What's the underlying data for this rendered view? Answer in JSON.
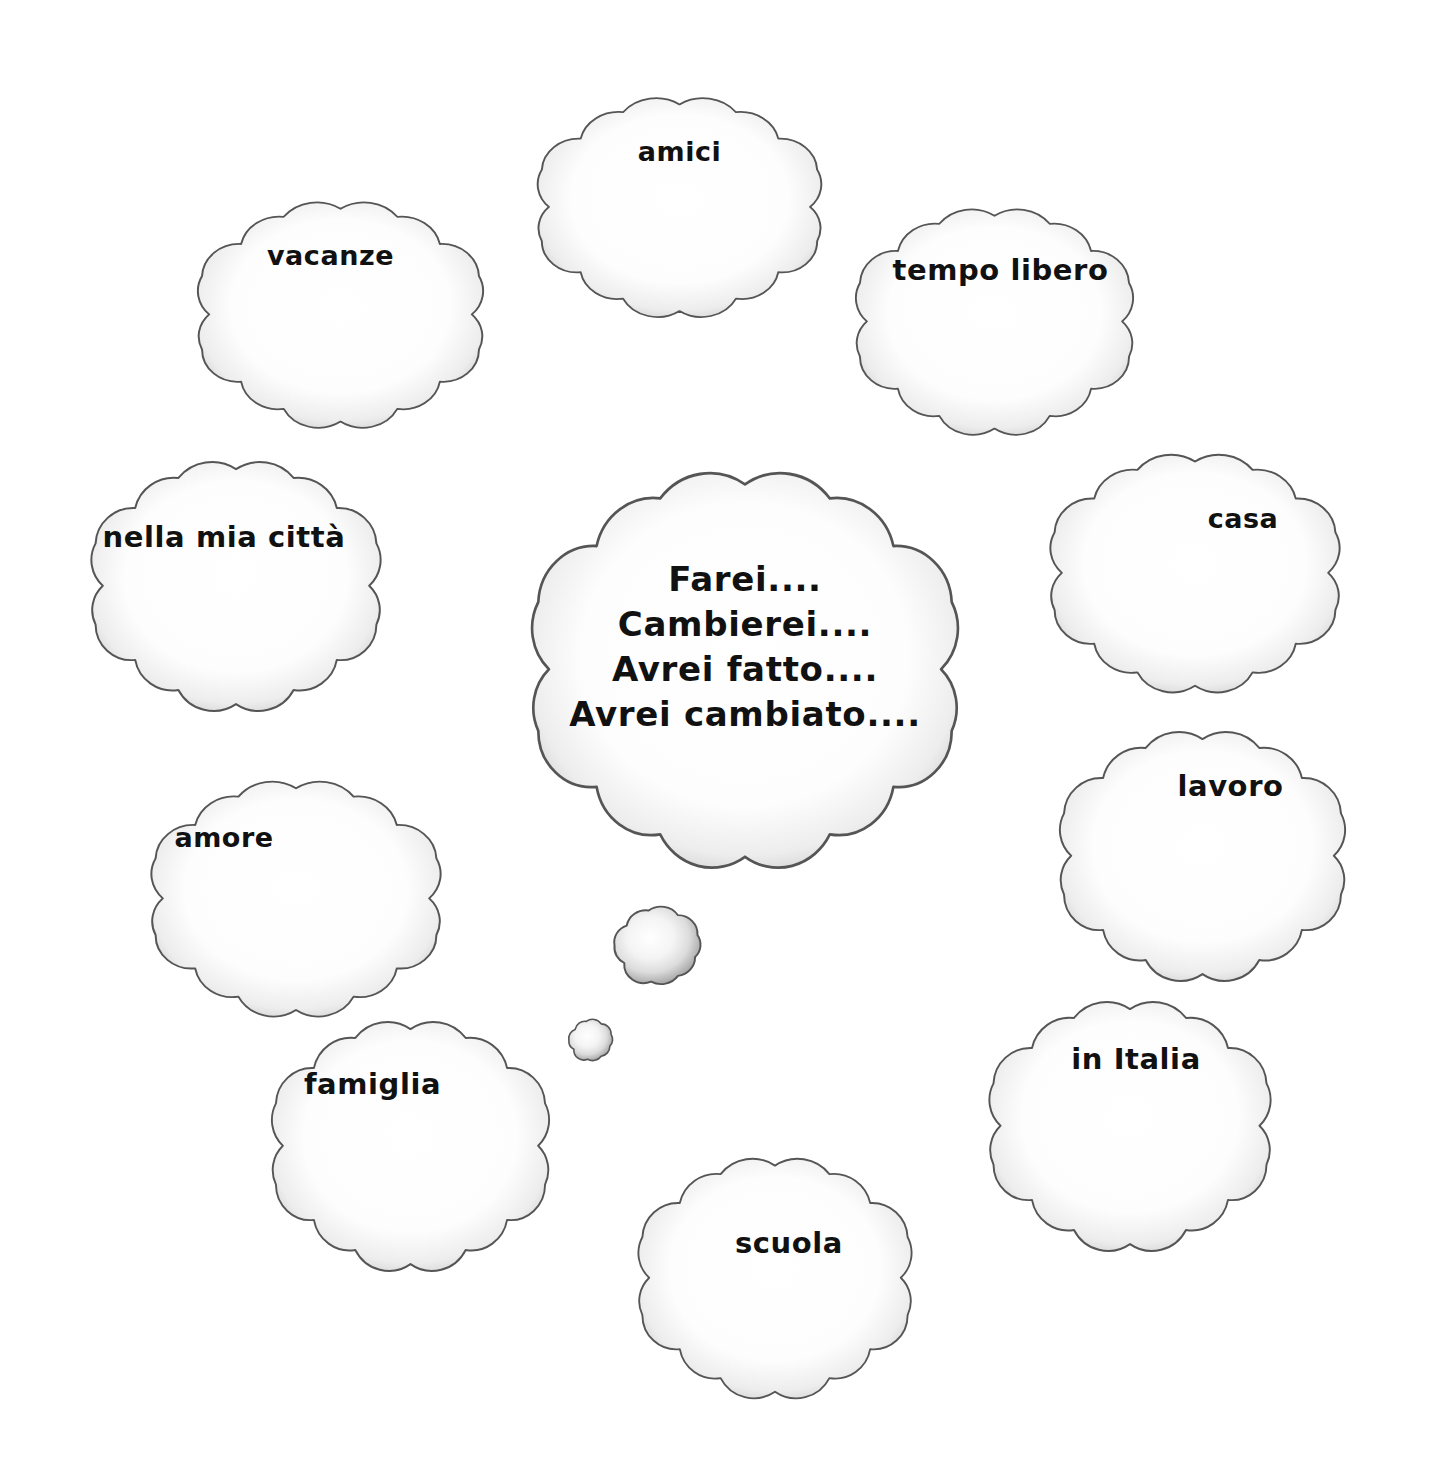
{
  "page": {
    "title": "Farei.... Cambierei.... Avrei fatto.... Avrei cambiato....",
    "language": "Italian",
    "background_color": "#ffffff",
    "outline_color": "#555555",
    "shading_color": "#9a9a9a",
    "text_color": "#111111"
  },
  "center_cloud": {
    "name": "central-thought-cloud",
    "lines": [
      "Farei....",
      "Cambierei....",
      "Avrei fatto....",
      "Avrei cambiato...."
    ],
    "text": "Farei....\nCambierei....\nAvrei fatto....\nAvrei cambiato....",
    "x": 480,
    "y": 462,
    "width": 530,
    "height": 420,
    "font_size": 34
  },
  "tail_bubbles": [
    {
      "name": "tail-bubble-large",
      "x": 595,
      "y": 893,
      "width": 122,
      "height": 105
    },
    {
      "name": "tail-bubble-small",
      "x": 559,
      "y": 1012,
      "width": 62,
      "height": 56
    }
  ],
  "topic_clouds": [
    {
      "id": "vacanze",
      "label": "vacanze",
      "x": 163,
      "y": 196,
      "width": 355,
      "height": 240,
      "font_size": 27,
      "text_top": 42,
      "text_shift": -10
    },
    {
      "id": "amici",
      "label": "amici",
      "x": 503,
      "y": 92,
      "width": 353,
      "height": 233,
      "font_size": 27,
      "text_top": 42,
      "text_shift": 0
    },
    {
      "id": "tempo-libero",
      "label": "tempo libero",
      "x": 822,
      "y": 203,
      "width": 345,
      "height": 240,
      "font_size": 29,
      "text_top": 48,
      "text_shift": 6
    },
    {
      "id": "nella-mia-citta",
      "label": "nella mia città",
      "x": 56,
      "y": 455,
      "width": 360,
      "height": 265,
      "font_size": 29,
      "text_top": 63,
      "text_shift": -12
    },
    {
      "id": "casa",
      "label": "casa",
      "x": 1015,
      "y": 448,
      "width": 360,
      "height": 253,
      "font_size": 27,
      "text_top": 53,
      "text_shift": 48
    },
    {
      "id": "amore",
      "label": "amore",
      "x": 116,
      "y": 775,
      "width": 360,
      "height": 250,
      "font_size": 27,
      "text_top": 45,
      "text_shift": -72
    },
    {
      "id": "lavoro",
      "label": "lavoro",
      "x": 1025,
      "y": 725,
      "width": 355,
      "height": 265,
      "font_size": 29,
      "text_top": 42,
      "text_shift": 28
    },
    {
      "id": "famiglia",
      "label": "famiglia",
      "x": 238,
      "y": 1015,
      "width": 345,
      "height": 265,
      "font_size": 29,
      "text_top": 50,
      "text_shift": -38
    },
    {
      "id": "in-italia",
      "label": "in Italia",
      "x": 955,
      "y": 995,
      "width": 350,
      "height": 265,
      "font_size": 29,
      "text_top": 45,
      "text_shift": 6
    },
    {
      "id": "scuola",
      "label": "scuola",
      "x": 605,
      "y": 1152,
      "width": 340,
      "height": 255,
      "font_size": 29,
      "text_top": 72,
      "text_shift": 14
    }
  ]
}
